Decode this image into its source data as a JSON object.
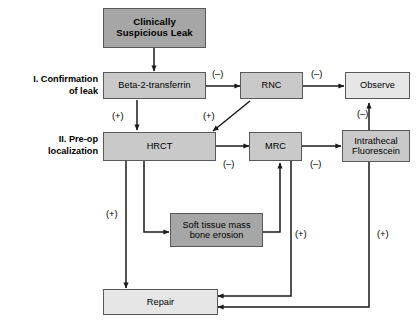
{
  "diagram": {
    "background": "#ffffff",
    "colors": {
      "dark_box": "#a6a6a6",
      "mid_box": "#c9c9c9",
      "light_box": "#e6e6e6",
      "border": "#58595b",
      "arrow": "#1a1a1a",
      "text": "#000000"
    },
    "stage_labels": [
      {
        "id": "stage-1",
        "line1": "I. Confirmation",
        "line2": "of leak"
      },
      {
        "id": "stage-2",
        "line1": "II. Pre-op",
        "line2": "localization"
      }
    ],
    "nodes": [
      {
        "id": "clinically-suspicious-leak",
        "line1": "Clinically",
        "line2": "Suspicious Leak",
        "shade": "dark",
        "bold": true
      },
      {
        "id": "beta-2-transferrin",
        "line1": "Beta-2-transferrin",
        "line2": "",
        "shade": "mid",
        "bold": false
      },
      {
        "id": "rnc",
        "line1": "RNC",
        "line2": "",
        "shade": "mid",
        "bold": false
      },
      {
        "id": "observe",
        "line1": "Observe",
        "line2": "",
        "shade": "light",
        "bold": false
      },
      {
        "id": "hrct",
        "line1": "HRCT",
        "line2": "",
        "shade": "mid",
        "bold": false
      },
      {
        "id": "mrc",
        "line1": "MRC",
        "line2": "",
        "shade": "mid",
        "bold": false
      },
      {
        "id": "intrathecal-fluorescein",
        "line1": "Intrathecal",
        "line2": "Fluorescein",
        "shade": "mid",
        "bold": false
      },
      {
        "id": "soft-tissue-mass",
        "line1": "Soft tissue mass",
        "line2": "bone erosion",
        "shade": "dark",
        "bold": false
      },
      {
        "id": "repair",
        "line1": "Repair",
        "line2": "",
        "shade": "light",
        "bold": false
      }
    ],
    "edge_labels": [
      {
        "id": "b2t-to-rnc",
        "text": "(–)"
      },
      {
        "id": "rnc-to-observe",
        "text": "(–)"
      },
      {
        "id": "b2t-to-hrct",
        "text": "(+)"
      },
      {
        "id": "rnc-to-hrct",
        "text": "(+)"
      },
      {
        "id": "hrct-to-mrc",
        "text": "(–)"
      },
      {
        "id": "mrc-to-fluorescein",
        "text": "(–)"
      },
      {
        "id": "fluorescein-to-observe",
        "text": "(–)"
      },
      {
        "id": "hrct-to-repair",
        "text": "(+)"
      },
      {
        "id": "mrc-to-repair",
        "text": "(+)"
      },
      {
        "id": "fluorescein-to-repair",
        "text": "(+)"
      }
    ]
  }
}
